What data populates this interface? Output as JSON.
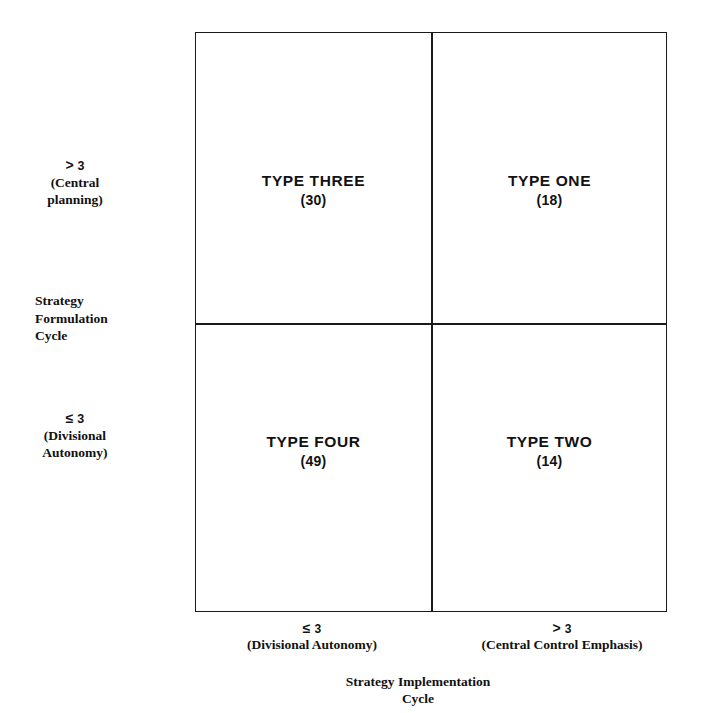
{
  "chart_data": {
    "type": "table",
    "xlabel": "Strategy Implementation Cycle",
    "ylabel": "Strategy Formulation Cycle",
    "grid": true,
    "legend": "none",
    "x_categories": [
      "≤ 3 (Divisional Autonomy)",
      "> 3 (Central Control Emphasis)"
    ],
    "y_categories": [
      "> 3 (Central planning)",
      "≤ 3 (Divisional Autonomy)"
    ],
    "cells": [
      {
        "row": "> 3 (Central planning)",
        "col": "≤ 3 (Divisional Autonomy)",
        "label": "TYPE THREE",
        "value": 30
      },
      {
        "row": "> 3 (Central planning)",
        "col": "> 3 (Central Control Emphasis)",
        "label": "TYPE ONE",
        "value": 18
      },
      {
        "row": "≤ 3 (Divisional Autonomy)",
        "col": "≤ 3 (Divisional Autonomy)",
        "label": "TYPE FOUR",
        "value": 49
      },
      {
        "row": "≤ 3 (Divisional Autonomy)",
        "col": "> 3 (Central Control Emphasis)",
        "label": "TYPE TWO",
        "value": 14
      }
    ],
    "values": [
      30,
      18,
      49,
      14
    ],
    "total": 111
  },
  "matrix": {
    "quadrants": {
      "top_left": {
        "title": "TYPE THREE",
        "count": "(30)"
      },
      "top_right": {
        "title": "TYPE ONE",
        "count": "(18)"
      },
      "bottom_left": {
        "title": "TYPE FOUR",
        "count": "(49)"
      },
      "bottom_right": {
        "title": "TYPE TWO",
        "count": "(14)"
      }
    }
  },
  "y_axis": {
    "title_line1": "Strategy",
    "title_line2": "Formulation",
    "title_line3": "Cycle",
    "high": {
      "operator": ">",
      "number": "3",
      "paren_line1": "(Central",
      "paren_line2": "planning)"
    },
    "low": {
      "operator": "≤",
      "number": "3",
      "paren_line1": "(Divisional",
      "paren_line2": "Autonomy)"
    }
  },
  "x_axis": {
    "title_line1": "Strategy Implementation",
    "title_line2": "Cycle",
    "left": {
      "operator": "≤",
      "number": "3",
      "paren": "(Divisional Autonomy)"
    },
    "right": {
      "operator": ">",
      "number": "3",
      "paren": "(Central Control Emphasis)"
    }
  },
  "colors": {
    "background": "#ffffff",
    "line": "#1a1a1a",
    "text": "#111111"
  }
}
